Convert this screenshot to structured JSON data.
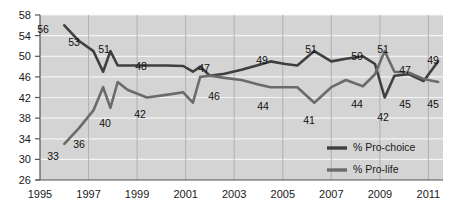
{
  "chart_data": {
    "type": "line",
    "title": "",
    "subtitle": "",
    "xlabel": "",
    "ylabel": "",
    "xlim": [
      1995,
      2011.6
    ],
    "ylim": [
      26,
      58
    ],
    "grid": true,
    "grid_orientation": "both",
    "legend_position": "inside-bottom-right",
    "plot_bg": "#d4d4d4",
    "y_ticks": [
      26,
      30,
      34,
      38,
      42,
      46,
      50,
      54,
      58
    ],
    "x_ticks": [
      1995,
      1997,
      1999,
      2001,
      2003,
      2005,
      2007,
      2009,
      2011
    ],
    "series": [
      {
        "name": "% Pro-choice",
        "color": "#3f3f3f",
        "width": 2.6,
        "x": [
          1996.0,
          1996.6,
          1997.2,
          1997.6,
          1997.9,
          1998.2,
          1998.6,
          1999.4,
          2000.2,
          2000.9,
          2001.3,
          2001.6,
          2002.0,
          2002.6,
          2003.3,
          2004.0,
          2004.5,
          2005.1,
          2005.6,
          2006.3,
          2007.0,
          2007.6,
          2008.3,
          2008.8,
          2009.2,
          2009.6,
          2010.2,
          2010.8,
          2011.4
        ],
        "values": [
          56,
          53,
          51,
          47,
          51,
          48.2,
          48.2,
          48.2,
          48.2,
          48.1,
          47,
          48,
          46.2,
          46.6,
          47.4,
          48.3,
          49,
          48.5,
          48.2,
          51,
          49,
          49.5,
          50,
          48.5,
          42,
          46.2,
          46.5,
          45.2,
          49
        ]
      },
      {
        "name": "% Pro-life",
        "color": "#6b6b6b",
        "width": 2.6,
        "x": [
          1996.0,
          1996.6,
          1997.2,
          1997.6,
          1997.9,
          1998.2,
          1998.6,
          1999.4,
          2000.2,
          2000.9,
          2001.3,
          2001.6,
          2002.0,
          2002.6,
          2003.3,
          2004.0,
          2004.5,
          2005.1,
          2005.6,
          2006.3,
          2007.0,
          2007.6,
          2008.3,
          2008.8,
          2009.2,
          2009.6,
          2010.2,
          2010.8,
          2011.4
        ],
        "values": [
          33,
          36,
          39.5,
          44,
          40,
          45,
          43.5,
          42,
          42.5,
          43,
          41,
          46,
          46.2,
          45.8,
          45.4,
          44.5,
          44,
          44,
          44,
          41,
          44,
          45.4,
          44.2,
          46.5,
          51,
          47,
          46.8,
          45.6,
          45
        ]
      }
    ],
    "point_labels": [
      {
        "text": "56",
        "x": 43,
        "y": 33,
        "series": "% Pro-choice"
      },
      {
        "text": "53",
        "x": 74,
        "y": 46,
        "series": "% Pro-choice"
      },
      {
        "text": "51",
        "x": 104,
        "y": 53,
        "series": "% Pro-choice"
      },
      {
        "text": "48",
        "x": 141,
        "y": 70,
        "series": "% Pro-choice"
      },
      {
        "text": "47",
        "x": 204,
        "y": 72,
        "series": "% Pro-choice"
      },
      {
        "text": "49",
        "x": 262,
        "y": 64,
        "series": "% Pro-choice"
      },
      {
        "text": "51",
        "x": 311,
        "y": 53,
        "series": "% Pro-choice"
      },
      {
        "text": "50",
        "x": 357,
        "y": 60,
        "series": "% Pro-choice"
      },
      {
        "text": "51",
        "x": 383,
        "y": 53,
        "series": "% Pro-choice"
      },
      {
        "text": "47",
        "x": 405,
        "y": 74,
        "series": "% Pro-choice"
      },
      {
        "text": "49",
        "x": 433,
        "y": 64,
        "series": "% Pro-choice"
      },
      {
        "text": "33",
        "x": 53,
        "y": 160,
        "series": "% Pro-life"
      },
      {
        "text": "36",
        "x": 79,
        "y": 148,
        "series": "% Pro-life"
      },
      {
        "text": "40",
        "x": 105,
        "y": 127,
        "series": "% Pro-life"
      },
      {
        "text": "42",
        "x": 140,
        "y": 118,
        "series": "% Pro-life"
      },
      {
        "text": "46",
        "x": 214,
        "y": 100,
        "series": "% Pro-life"
      },
      {
        "text": "44",
        "x": 263,
        "y": 110,
        "series": "% Pro-life"
      },
      {
        "text": "41",
        "x": 309,
        "y": 124,
        "series": "% Pro-life"
      },
      {
        "text": "44",
        "x": 357,
        "y": 108,
        "series": "% Pro-life"
      },
      {
        "text": "42",
        "x": 383,
        "y": 121,
        "series": "% Pro-life"
      },
      {
        "text": "45",
        "x": 405,
        "y": 108,
        "series": "% Pro-life"
      },
      {
        "text": "45",
        "x": 433,
        "y": 108,
        "series": "% Pro-life"
      }
    ],
    "legend": [
      {
        "label": "% Pro-choice",
        "color": "#3f3f3f"
      },
      {
        "label": "% Pro-life",
        "color": "#6b6b6b"
      }
    ]
  }
}
